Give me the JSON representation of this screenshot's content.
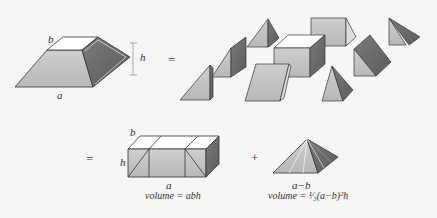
{
  "figure": {
    "frustum": {
      "label_top": "b",
      "label_height": "h",
      "label_bottom": "a"
    },
    "equals_1": "=",
    "equals_2": "=",
    "plus": "+",
    "prism_block": {
      "label_top": "b",
      "label_height": "h",
      "label_bottom": "a",
      "caption": "volume = abh"
    },
    "pyramid": {
      "label_bottom": "a−b",
      "caption": "volume = ¹⁄₃(a−b)²h"
    },
    "colors": {
      "light_face": "#c9c9c7",
      "dark_face": "#6e6e6e",
      "top_face": "#ffffff",
      "stroke": "#333333",
      "background": "#f6f6f4"
    },
    "exploded_pieces": [
      "pyramid",
      "prism",
      "prism",
      "cube",
      "prism",
      "prism",
      "pyramid",
      "prism",
      "pyramid"
    ]
  }
}
